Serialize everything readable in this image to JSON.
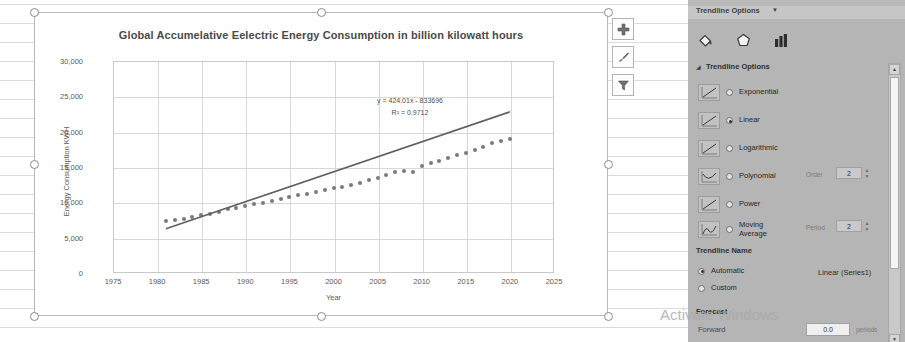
{
  "chart_data": {
    "type": "scatter",
    "title": "Global Accumelative Eelectric Energy Consumption in billion kilowatt hours",
    "xlabel": "Year",
    "ylabel": "Energy Consumption KWH",
    "xlim": [
      1975,
      2025
    ],
    "ylim": [
      0,
      30000
    ],
    "xticks": [
      "1975",
      "1980",
      "1985",
      "1990",
      "1995",
      "2000",
      "2005",
      "2010",
      "2015",
      "2020",
      "2025"
    ],
    "yticks": [
      "0",
      "5,000",
      "10,000",
      "15,000",
      "20,000",
      "25,000",
      "30,000"
    ],
    "grid": true,
    "legend": "none",
    "series": [
      {
        "name": "Series1",
        "x": [
          1981,
          1982,
          1983,
          1984,
          1985,
          1986,
          1987,
          1988,
          1989,
          1990,
          1991,
          1992,
          1993,
          1994,
          1995,
          1996,
          1997,
          1998,
          1999,
          2000,
          2001,
          2002,
          2003,
          2004,
          2005,
          2006,
          2007,
          2008,
          2009,
          2010,
          2011,
          2012,
          2013,
          2014,
          2015,
          2016,
          2017,
          2018,
          2019,
          2020
        ],
        "y": [
          7300,
          7450,
          7650,
          7900,
          8150,
          8400,
          8700,
          9000,
          9250,
          9500,
          9700,
          9900,
          10150,
          10450,
          10750,
          11000,
          11250,
          11450,
          11700,
          12000,
          12200,
          12400,
          12700,
          13100,
          13500,
          13900,
          14300,
          14500,
          14300,
          15100,
          15600,
          15900,
          16300,
          16700,
          17000,
          17400,
          17900,
          18400,
          18700,
          19000
        ]
      }
    ],
    "trendline": {
      "type": "Linear",
      "equation": "y = 424.01x - 833696",
      "r_squared": "R² = 0.9712",
      "slope": 424.01,
      "intercept": -833696
    }
  },
  "chart_buttons": [
    {
      "name": "chart-elements",
      "glyph": "+"
    },
    {
      "name": "chart-styles",
      "glyph": "brush"
    },
    {
      "name": "chart-filters",
      "glyph": "funnel"
    }
  ],
  "pane": {
    "header_title": "Trendline Options",
    "header_caret": "▼",
    "icons": [
      {
        "name": "fill-line-icon",
        "label": "Fill & Line"
      },
      {
        "name": "effects-icon",
        "label": "Effects"
      },
      {
        "name": "trendline-options-icon",
        "label": "Trendline Options"
      }
    ],
    "section_trendline_options": "Trendline Options",
    "section_caret": "◢",
    "options": [
      {
        "label": "Exponential",
        "mnemonic": "E",
        "selected": false
      },
      {
        "label": "Linear",
        "mnemonic": "L",
        "selected": true
      },
      {
        "label": "Logarithmic",
        "mnemonic": "L",
        "selected": false
      },
      {
        "label": "Polynomial",
        "mnemonic": "P",
        "selected": false,
        "spin_label": "Order",
        "spin_value": "2"
      },
      {
        "label": "Power",
        "mnemonic": "P",
        "selected": false
      },
      {
        "label": "Moving Average",
        "mnemonic": "M",
        "selected": false,
        "spin_label": "Period",
        "spin_value": "2"
      }
    ],
    "section_trendline_name": "Trendline Name",
    "name_options": [
      {
        "label": "Automatic",
        "selected": true,
        "value": "Linear (Series1)"
      },
      {
        "label": "Custom",
        "selected": false,
        "value": ""
      }
    ],
    "section_forecast": "Forecast",
    "forecast_forward_label": "Forward",
    "forecast_forward_value": "0.0",
    "forecast_period_unit": "periods"
  },
  "watermark": "Activate Windows"
}
